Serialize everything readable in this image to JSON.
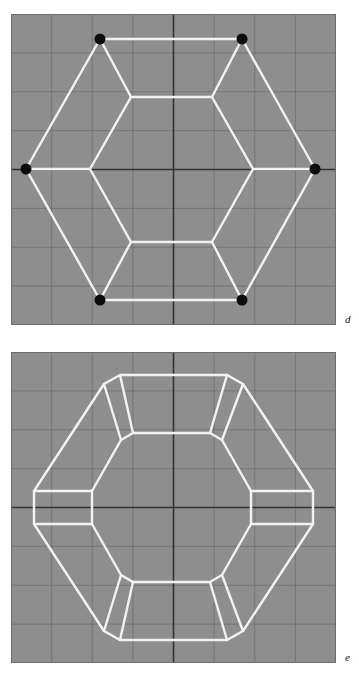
{
  "figure": {
    "background_color": "#ffffff",
    "panel_fill_color": "#8e8e8e",
    "panel_border_color": "#6e6e6e",
    "grid_color": "#6a6a6a",
    "axis_color": "#333333",
    "edge_color": "#f2f2f2",
    "vertex_color": "#0d0d0d",
    "panels": [
      {
        "id": "d",
        "label": "d",
        "geometry_type": "hexagonal-projection-with-vertex-markers",
        "viewbox": "0 0 325 311",
        "grid": {
          "spacing_x": 40.6,
          "spacing_y": 38.9,
          "columns": 8,
          "rows": 8,
          "show": true
        },
        "axes": {
          "center_x": 162.5,
          "center_y": 155.5,
          "horizontal": true,
          "vertical": true
        },
        "outer_hexagon": [
          [
            89,
            25
          ],
          [
            231,
            25
          ],
          [
            304,
            155
          ],
          [
            231,
            286
          ],
          [
            89,
            286
          ],
          [
            15,
            155
          ]
        ],
        "inner_hexagon": [
          [
            120,
            83
          ],
          [
            201,
            83
          ],
          [
            242,
            155
          ],
          [
            201,
            228
          ],
          [
            120,
            228
          ],
          [
            79,
            155
          ]
        ],
        "spokes": [
          [
            [
              89,
              25
            ],
            [
              120,
              83
            ]
          ],
          [
            [
              231,
              25
            ],
            [
              201,
              83
            ]
          ],
          [
            [
              304,
              155
            ],
            [
              242,
              155
            ]
          ],
          [
            [
              231,
              286
            ],
            [
              201,
              228
            ]
          ],
          [
            [
              89,
              286
            ],
            [
              120,
              228
            ]
          ],
          [
            [
              15,
              155
            ],
            [
              79,
              155
            ]
          ]
        ],
        "vertex_markers": [
          {
            "x": 89,
            "y": 25,
            "r": 5.5
          },
          {
            "x": 231,
            "y": 25,
            "r": 5.5
          },
          {
            "x": 304,
            "y": 155,
            "r": 5.5
          },
          {
            "x": 231,
            "y": 286,
            "r": 5.5
          },
          {
            "x": 89,
            "y": 286,
            "r": 5.5
          },
          {
            "x": 15,
            "y": 155,
            "r": 5.5
          }
        ],
        "vertex_marker_count": 6
      },
      {
        "id": "e",
        "label": "e",
        "geometry_type": "truncated-hexagonal-projection-chamfered",
        "viewbox": "0 0 325 311",
        "grid": {
          "spacing_x": 40.6,
          "spacing_y": 38.9,
          "columns": 8,
          "rows": 8,
          "show": true
        },
        "axes": {
          "center_x": 162.5,
          "center_y": 155.5,
          "horizontal": true,
          "vertical": true
        },
        "outer_truncated_polygon": [
          [
            109,
            23
          ],
          [
            216,
            23
          ],
          [
            232,
            32
          ],
          [
            302,
            139
          ],
          [
            302,
            172
          ],
          [
            232,
            279
          ],
          [
            216,
            288
          ],
          [
            109,
            288
          ],
          [
            93,
            279
          ],
          [
            23,
            172
          ],
          [
            23,
            139
          ],
          [
            93,
            32
          ]
        ],
        "inner_truncated_polygon": [
          [
            122,
            81
          ],
          [
            199,
            81
          ],
          [
            211,
            88
          ],
          [
            240,
            139
          ],
          [
            240,
            172
          ],
          [
            211,
            223
          ],
          [
            199,
            230
          ],
          [
            122,
            230
          ],
          [
            110,
            223
          ],
          [
            81,
            172
          ],
          [
            81,
            139
          ],
          [
            110,
            88
          ]
        ],
        "spokes": [
          [
            [
              93,
              32
            ],
            [
              110,
              88
            ]
          ],
          [
            [
              109,
              23
            ],
            [
              122,
              81
            ]
          ],
          [
            [
              216,
              23
            ],
            [
              199,
              81
            ]
          ],
          [
            [
              232,
              32
            ],
            [
              211,
              88
            ]
          ],
          [
            [
              302,
              139
            ],
            [
              240,
              139
            ]
          ],
          [
            [
              302,
              172
            ],
            [
              240,
              172
            ]
          ],
          [
            [
              232,
              279
            ],
            [
              211,
              223
            ]
          ],
          [
            [
              216,
              288
            ],
            [
              199,
              230
            ]
          ],
          [
            [
              109,
              288
            ],
            [
              122,
              230
            ]
          ],
          [
            [
              93,
              279
            ],
            [
              110,
              223
            ]
          ],
          [
            [
              23,
              139
            ],
            [
              81,
              139
            ]
          ],
          [
            [
              23,
              172
            ],
            [
              81,
              172
            ]
          ]
        ],
        "chamfer_count": 12,
        "vertex_marker_count": 0
      }
    ]
  }
}
